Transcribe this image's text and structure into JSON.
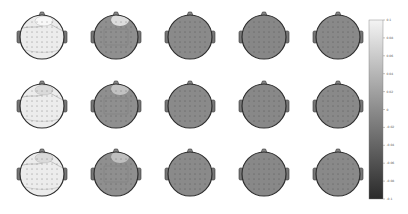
{
  "chart_data": {
    "type": "heatmap",
    "title": "",
    "subtype": "scalp topography grid",
    "layout": {
      "rows": 3,
      "cols": 5
    },
    "colormap": "grayscale",
    "colorbar": {
      "position": "right",
      "vmin": -0.1,
      "vmax": 0.1,
      "ticks": [
        "0.1",
        "0.08",
        "0.06",
        "0.04",
        "0.02",
        "0",
        "-0.02",
        "-0.04",
        "-0.06",
        "-0.08",
        "-0.1"
      ],
      "color_max": "#f2f2f2",
      "color_min": "#2a2a2a"
    },
    "panels": [
      {
        "row": 0,
        "col": 0,
        "fill": "#ececec",
        "highlight": "#f8f8f8",
        "description": "mostly high values, contour lines near frontal region"
      },
      {
        "row": 0,
        "col": 1,
        "fill": "#8f8f8f",
        "highlight": "#e6e6e6",
        "description": "near zero with frontal positive patch"
      },
      {
        "row": 0,
        "col": 2,
        "fill": "#8a8a8a",
        "highlight": null,
        "description": "near zero"
      },
      {
        "row": 0,
        "col": 3,
        "fill": "#878787",
        "highlight": null,
        "description": "near zero"
      },
      {
        "row": 0,
        "col": 4,
        "fill": "#898989",
        "highlight": null,
        "description": "near zero"
      },
      {
        "row": 1,
        "col": 0,
        "fill": "#ececec",
        "highlight": "#dadada",
        "description": "mostly high values, frontal contour"
      },
      {
        "row": 1,
        "col": 1,
        "fill": "#8f8f8f",
        "highlight": "#c8c8c8",
        "description": "near zero with frontal positive patch"
      },
      {
        "row": 1,
        "col": 2,
        "fill": "#8a8a8a",
        "highlight": null,
        "description": "near zero"
      },
      {
        "row": 1,
        "col": 3,
        "fill": "#888888",
        "highlight": null,
        "description": "near zero"
      },
      {
        "row": 1,
        "col": 4,
        "fill": "#898989",
        "highlight": null,
        "description": "near zero"
      },
      {
        "row": 2,
        "col": 0,
        "fill": "#ececec",
        "highlight": "#dadada",
        "description": "mostly high values, frontal contour"
      },
      {
        "row": 2,
        "col": 1,
        "fill": "#8f8f8f",
        "highlight": "#c4c4c4",
        "description": "near zero with frontal positive patch"
      },
      {
        "row": 2,
        "col": 2,
        "fill": "#8a8a8a",
        "highlight": null,
        "description": "near zero"
      },
      {
        "row": 2,
        "col": 3,
        "fill": "#888888",
        "highlight": null,
        "description": "near zero"
      },
      {
        "row": 2,
        "col": 4,
        "fill": "#898989",
        "highlight": null,
        "description": "near zero"
      }
    ],
    "xlabel": "",
    "ylabel": "",
    "grid": false
  }
}
